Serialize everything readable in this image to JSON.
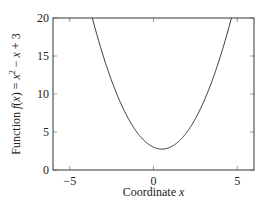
{
  "chart_data": {
    "type": "line",
    "title": "",
    "xlabel": "Coordinate x",
    "ylabel": "Function f(x) = x² − x + 3",
    "xlim": [
      -6,
      6
    ],
    "ylim": [
      0,
      20
    ],
    "x_ticks": [
      -5,
      0,
      5
    ],
    "y_ticks": [
      0,
      5,
      10,
      15,
      20
    ],
    "x_tick_labels": [
      "−5",
      "0",
      "5"
    ],
    "y_tick_labels": [
      "0",
      "5",
      "10",
      "15",
      "20"
    ],
    "grid": false,
    "legend": null,
    "series": [
      {
        "name": "f(x) = x^2 - x + 3",
        "function": "x^2 - x + 3",
        "color": "#222222",
        "x": [
          -3.7,
          -3.5,
          -3,
          -2.5,
          -2,
          -1.5,
          -1,
          -0.5,
          0,
          0.5,
          1,
          1.5,
          2,
          2.5,
          3,
          3.5,
          4,
          4.7
        ],
        "y": [
          20.39,
          18.75,
          15,
          11.75,
          9,
          6.75,
          5,
          3.75,
          3,
          2.75,
          3,
          3.75,
          5,
          6.75,
          9,
          11.75,
          15,
          20.39
        ]
      }
    ]
  }
}
